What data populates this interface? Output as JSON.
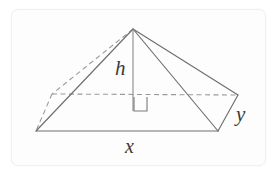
{
  "figure": {
    "labels": {
      "height": "h",
      "base_length": "x",
      "base_width": "y"
    },
    "colors": {
      "card_background": "#fdfdfd",
      "card_border": "#f0f0f0",
      "solid_edge": "#6e6e72",
      "hidden_edge": "#9a9a9e",
      "altitude_line": "#8a8a8e",
      "right_angle_mark": "#7a7a7e",
      "label_text": "#3a3a3a",
      "page_background": "#ffffff"
    },
    "geometry": {
      "apex": [
        133,
        29
      ],
      "front_left": [
        36,
        131
      ],
      "front_right": [
        218,
        131
      ],
      "back_left": [
        52,
        94
      ],
      "back_right": [
        238,
        95
      ],
      "base_center": [
        133,
        111
      ],
      "right_angle_square": [
        134,
        97,
        13,
        14
      ]
    },
    "edges": [
      {
        "name": "apex-to-front-left",
        "style": "solid"
      },
      {
        "name": "apex-to-front-right",
        "style": "solid"
      },
      {
        "name": "apex-to-back-right",
        "style": "solid"
      },
      {
        "name": "apex-to-back-left",
        "style": "dashed"
      },
      {
        "name": "base-front",
        "style": "solid"
      },
      {
        "name": "base-right",
        "style": "solid"
      },
      {
        "name": "base-back",
        "style": "dashed"
      },
      {
        "name": "base-left",
        "style": "dashed"
      },
      {
        "name": "altitude",
        "style": "solid"
      }
    ]
  }
}
